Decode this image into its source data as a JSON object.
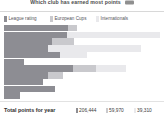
{
  "header": {
    "title": "Which club has earned most points",
    "badge_icon": "menu-badge-icon"
  },
  "legend": {
    "items": [
      {
        "label": "League rating",
        "color": "#8d8d93",
        "icon": "legend-swatch-icon"
      },
      {
        "label": "European Cups",
        "color": "#c9c9cd",
        "icon": "legend-swatch-icon"
      },
      {
        "label": "Internationals",
        "color": "#e9e9ec",
        "icon": "legend-swatch-icon"
      }
    ]
  },
  "footer": {
    "total_label": "Total points for year",
    "totals": [
      {
        "value": "206,444",
        "color": "#8d8d93"
      },
      {
        "value": "59,970",
        "color": "#c9c9cd"
      },
      {
        "value": "39,310",
        "color": "#e9e9ec"
      }
    ]
  },
  "chart_data": {
    "type": "bar",
    "orientation": "horizontal",
    "stacked": true,
    "title": "Which club has earned most points",
    "xlabel": "",
    "ylabel": "",
    "grid": false,
    "legend_position": "top-left",
    "series": [
      {
        "name": "League rating",
        "color": "#8d8d93",
        "values": [
          41,
          47,
          31,
          28,
          36,
          13,
          44,
          28,
          25,
          33,
          10
        ]
      },
      {
        "name": "European Cups",
        "color": "#c9c9cd",
        "values": [
          6,
          0,
          14,
          0,
          0,
          0,
          15,
          10,
          0,
          0,
          0
        ]
      },
      {
        "name": "Internationals",
        "color": "#e9e9ec",
        "values": [
          0,
          69,
          0,
          60,
          17,
          0,
          19,
          0,
          0,
          0,
          0
        ]
      }
    ],
    "categories": [
      "1",
      "2",
      "3",
      "4",
      "5",
      "6",
      "7",
      "8",
      "9",
      "10",
      "11"
    ],
    "xlim": [
      0,
      100
    ],
    "totals": {
      "League rating": 206444,
      "European Cups": 59970,
      "Internationals": 39310
    }
  }
}
